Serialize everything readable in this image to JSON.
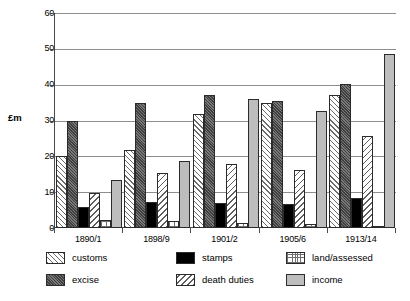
{
  "chart_data": {
    "type": "bar",
    "title": "",
    "xlabel": "",
    "ylabel": "£m",
    "ylim": [
      0,
      60
    ],
    "yticks": [
      0,
      10,
      20,
      30,
      40,
      50,
      60
    ],
    "grid": true,
    "legend_position": "bottom",
    "categories": [
      "1890/1",
      "1898/9",
      "1901/2",
      "1905/6",
      "1913/14"
    ],
    "series": [
      {
        "name": "customs",
        "pattern": "diagonal-hatch-up",
        "values": [
          20.1,
          21.8,
          31.7,
          34.9,
          37.0
        ]
      },
      {
        "name": "excise",
        "pattern": "solid-dark-grey",
        "values": [
          30.0,
          34.9,
          37.0,
          35.4,
          40.2
        ]
      },
      {
        "name": "stamps",
        "pattern": "solid-black",
        "values": [
          5.9,
          7.2,
          6.9,
          6.8,
          8.3
        ]
      },
      {
        "name": "death duties",
        "pattern": "diagonal-hatch-down",
        "values": [
          9.9,
          15.4,
          17.8,
          16.2,
          25.8
        ]
      },
      {
        "name": "land/assessed",
        "pattern": "cross-grid",
        "values": [
          2.3,
          1.9,
          1.5,
          1.1,
          0.7
        ]
      },
      {
        "name": "income",
        "pattern": "solid-light-grey",
        "values": [
          13.4,
          18.6,
          36.0,
          32.6,
          48.7
        ]
      }
    ]
  },
  "legend": {
    "items": [
      {
        "label": "customs"
      },
      {
        "label": "stamps"
      },
      {
        "label": "land/assessed"
      },
      {
        "label": "excise"
      },
      {
        "label": "death duties"
      },
      {
        "label": "income"
      }
    ]
  }
}
